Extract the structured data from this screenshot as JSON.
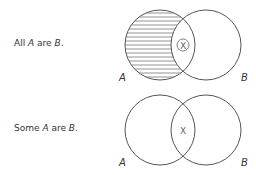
{
  "diagrams": [
    {
      "statement": {
        "prefix": "All ",
        "a": "A",
        "middle": " are ",
        "b": "B",
        "suffix": "."
      },
      "label_a": "A",
      "label_b": "B",
      "marker": "X",
      "marker_circled": true,
      "shading": "A only (horizontal hatching)"
    },
    {
      "statement": {
        "prefix": "Some ",
        "a": "A",
        "middle": " are ",
        "b": "B",
        "suffix": "."
      },
      "label_a": "A",
      "label_b": "B",
      "marker": "X",
      "marker_circled": false,
      "shading": "none"
    }
  ],
  "colors": {
    "stroke": "#555555",
    "hatch": "#777777",
    "text": "#333333"
  }
}
